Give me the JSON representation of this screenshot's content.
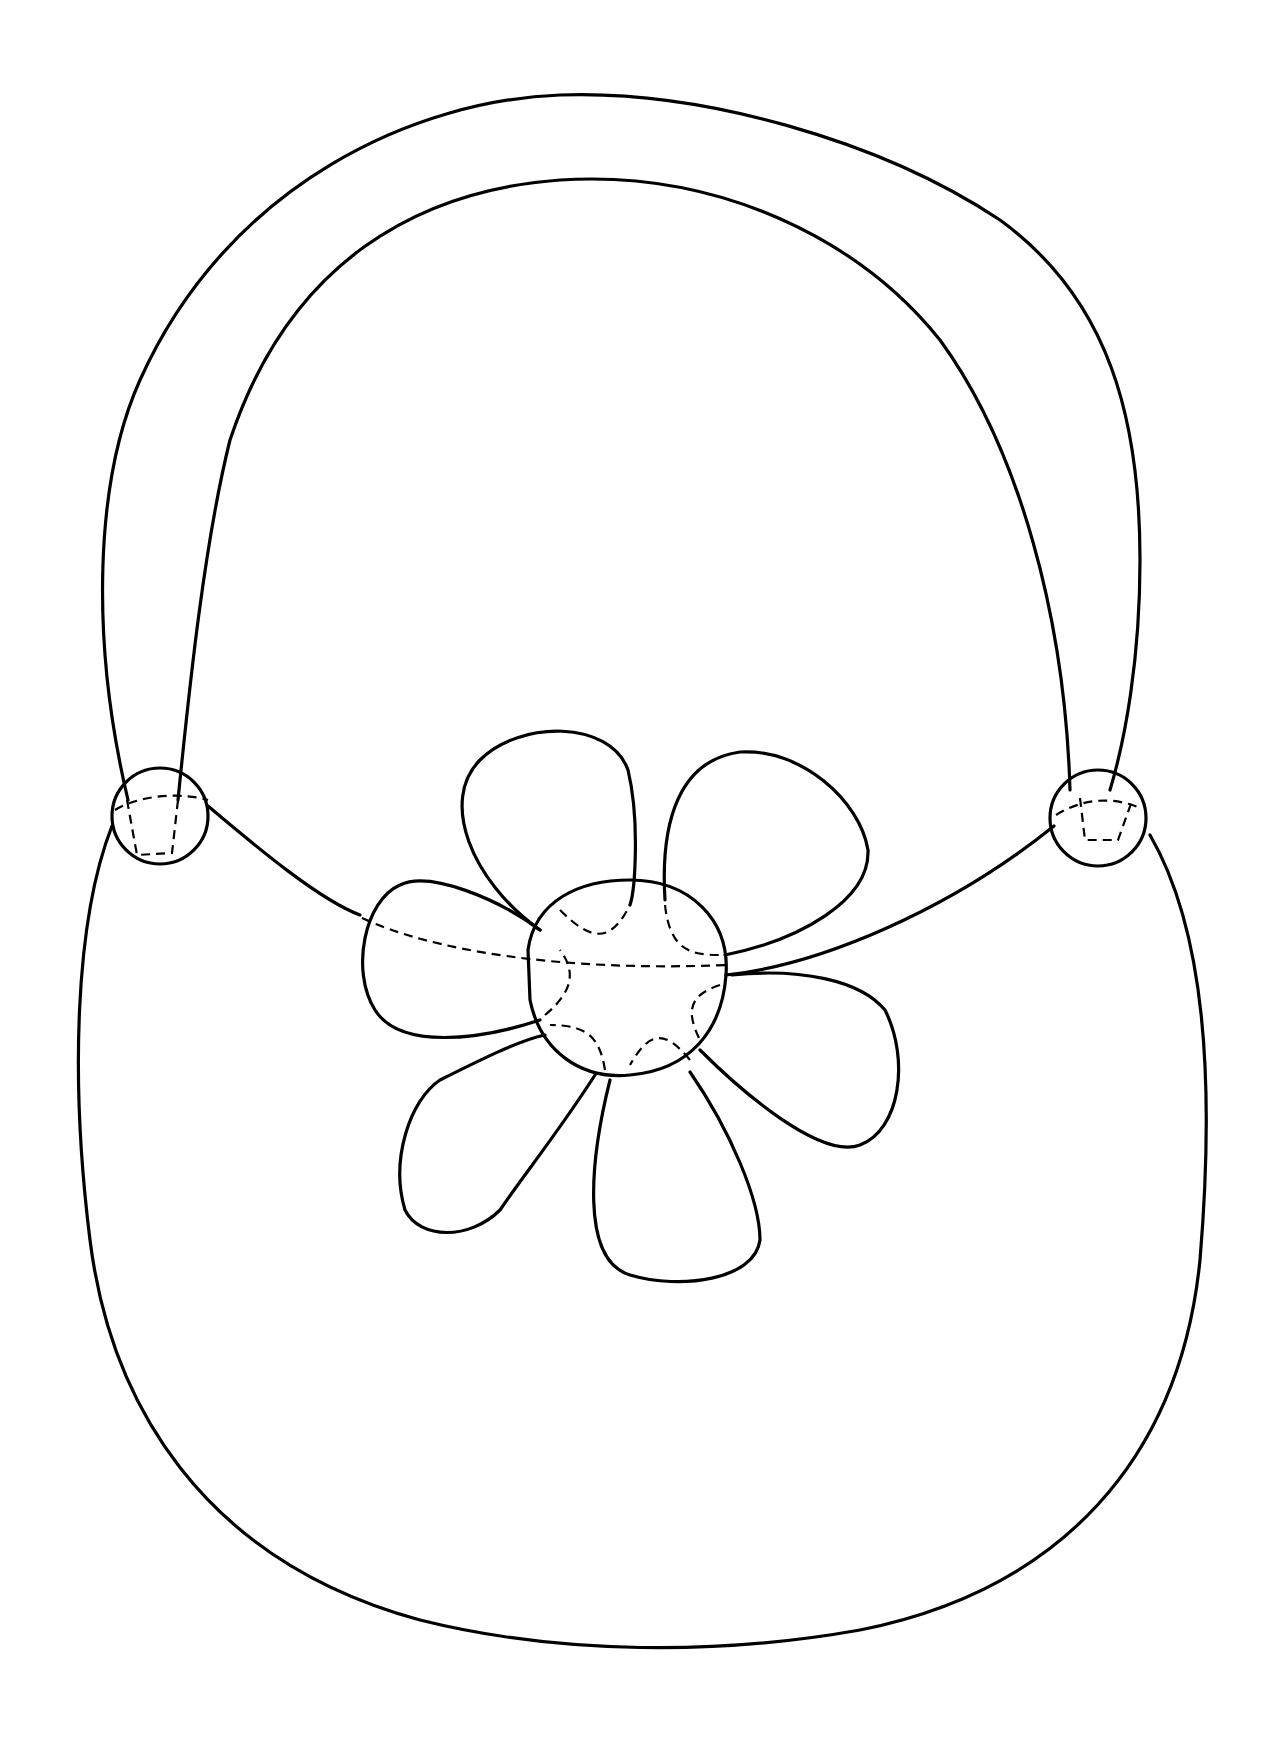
{
  "drawing": {
    "subject": "handbag with flower coloring page",
    "background_color": "#ffffff",
    "line_color": "#000000",
    "parts": [
      "handle",
      "left-rivet",
      "right-rivet",
      "bag-body",
      "flower-center",
      "flower-petals"
    ]
  }
}
